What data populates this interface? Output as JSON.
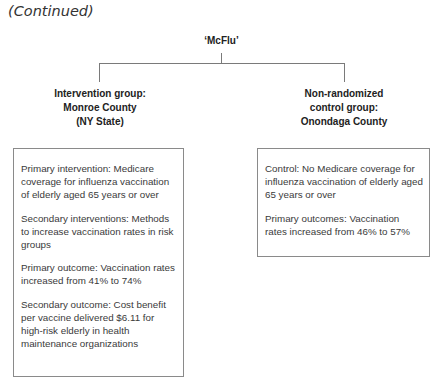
{
  "header": {
    "continued_label": "(Continued)"
  },
  "diagram": {
    "title": "‘McFlu’",
    "intervention_group": {
      "label_lines": [
        "Intervention group:",
        "Monroe County",
        "(NY State)"
      ],
      "items": [
        "Primary intervention: Medicare coverage for influenza vaccination of elderly aged 65 years or over",
        "Secondary interventions: Methods to increase vaccination rates in risk groups",
        "Primary outcome: Vaccination rates increased from 41% to 74%",
        "Secondary outcome: Cost benefit per vaccine delivered $6.11 for high-risk elderly in health maintenance organizations"
      ]
    },
    "control_group": {
      "label_lines": [
        "Non-randomized",
        "control group:",
        "Onondaga County"
      ],
      "items": [
        "Control: No Medicare coverage for influenza vaccination of elderly aged 65 years or over",
        "Primary outcomes: Vaccination rates increased from 46% to 57%"
      ]
    }
  }
}
